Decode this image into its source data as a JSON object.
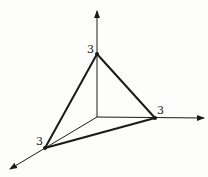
{
  "diagram": {
    "type": "3d-axes-plane-intercepts",
    "axes": [
      {
        "name": "vertical-axis",
        "direction": "up"
      },
      {
        "name": "horizontal-axis",
        "direction": "right"
      },
      {
        "name": "depth-axis",
        "direction": "down-left"
      }
    ],
    "intercepts": [
      {
        "axis": "vertical-axis",
        "label": "3"
      },
      {
        "axis": "horizontal-axis",
        "label": "3"
      },
      {
        "axis": "depth-axis",
        "label": "3"
      }
    ],
    "colors": {
      "line": "#1a1a1a",
      "background": "#fdfdfb"
    }
  }
}
